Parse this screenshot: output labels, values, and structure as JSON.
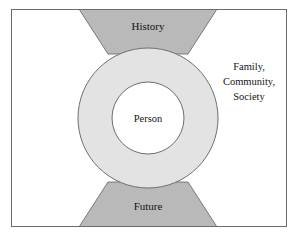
{
  "diagram": {
    "frame": {
      "border_color": "#6b6b6b",
      "background_color": "#ffffff"
    },
    "colors": {
      "wedge_fill": "#b9b9b9",
      "wedge_stroke": "#6f6f6f",
      "ring_fill": "#e3e3e3",
      "ring_stroke": "#6f6f6f",
      "core_fill": "#ffffff",
      "core_stroke": "#6f6f6f",
      "text_color": "#141414"
    },
    "regions": {
      "top_wedge_label": "History",
      "bottom_wedge_label": "Future",
      "core_label": "Person",
      "outer_label_lines": [
        "Family,",
        "Community,",
        "Society"
      ]
    }
  }
}
